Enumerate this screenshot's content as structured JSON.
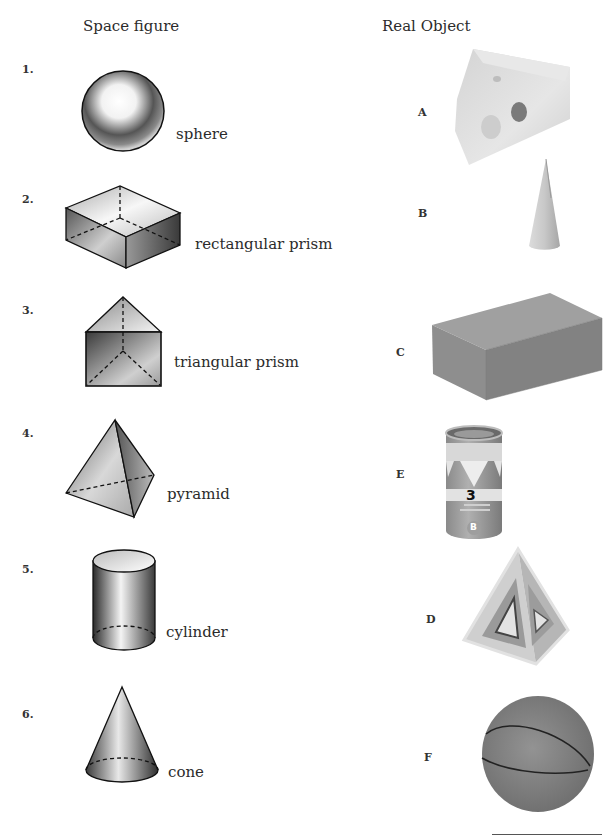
{
  "headers": {
    "left": "Space figure",
    "right": "Real Object"
  },
  "space_figures": [
    {
      "number": "1.",
      "name": "sphere",
      "icon": "sphere-figure"
    },
    {
      "number": "2.",
      "name": "rectangular prism",
      "icon": "rectangular-prism-figure"
    },
    {
      "number": "3.",
      "name": "triangular prism",
      "icon": "triangular-prism-figure"
    },
    {
      "number": "4.",
      "name": "pyramid",
      "icon": "pyramid-figure"
    },
    {
      "number": "5.",
      "name": "cylinder",
      "icon": "cylinder-figure"
    },
    {
      "number": "6.",
      "name": "cone",
      "icon": "cone-figure"
    }
  ],
  "real_objects": [
    {
      "letter": "A",
      "object": "cheese wedge photo"
    },
    {
      "letter": "B",
      "object": "ice cream cone photo"
    },
    {
      "letter": "C",
      "object": "cardboard box photo"
    },
    {
      "letter": "E",
      "object": "shuttlecock can photo",
      "can_label_number": "3",
      "can_label_badge": "B"
    },
    {
      "letter": "D",
      "object": "triangular pyramid photo"
    },
    {
      "letter": "F",
      "object": "ball photo"
    }
  ],
  "colors": {
    "text": "#2b2b2b",
    "figure_stroke": "#111111",
    "box": "#8a8a8a",
    "ball": "#7a7a7a",
    "cheese": "#d9d9d9"
  }
}
